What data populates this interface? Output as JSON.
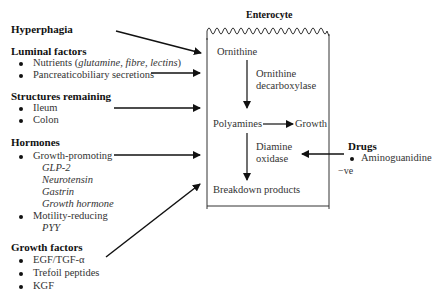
{
  "diagram": {
    "cell_title": "Enterocyte",
    "cell_contents": {
      "ornithine": "Ornithine",
      "enzyme1": [
        "Ornithine",
        "decarboxylase"
      ],
      "polyamines": "Polyamines",
      "growth": "Growth",
      "enzyme2": [
        "Diamine",
        "oxidase"
      ],
      "breakdown": "Breakdown products"
    },
    "left_groups": {
      "hyperphagia": {
        "heading": "Hyperphagia"
      },
      "luminal": {
        "heading": "Luminal factors",
        "items": [
          "Nutrients (",
          "glutamine, fibre, lectins",
          ")",
          "Pancreaticobiliary secretions"
        ]
      },
      "structures": {
        "heading": "Structures remaining",
        "items": [
          "Ileum",
          "Colon"
        ]
      },
      "hormones": {
        "heading": "Hormones",
        "growth_promoting": "Growth-promoting",
        "growth_promoting_list": [
          "GLP-2",
          "Neurotensin",
          "Gastrin",
          "Growth hormone"
        ],
        "motility_reducing": "Motility-reducing",
        "motility_reducing_list": [
          "PYY"
        ]
      },
      "growth_factors": {
        "heading": "Growth factors",
        "items": [
          "EGF/TGF-α",
          "Trefoil peptides",
          "KGF"
        ]
      }
    },
    "right_group": {
      "heading": "Drugs",
      "items": [
        "Aminoguanidine"
      ],
      "effect": "−ve"
    }
  }
}
